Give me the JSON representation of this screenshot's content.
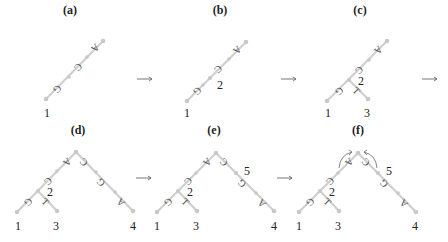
{
  "figure": {
    "panels": [
      {
        "id": "a",
        "label": "(a)",
        "numbers": [
          "1"
        ]
      },
      {
        "id": "b",
        "label": "(b)",
        "numbers": [
          "1",
          "2"
        ]
      },
      {
        "id": "c",
        "label": "(c)",
        "numbers": [
          "1",
          "2",
          "3"
        ]
      },
      {
        "id": "d",
        "label": "(d)",
        "numbers": [
          "1",
          "2",
          "3",
          "4"
        ]
      },
      {
        "id": "e",
        "label": "(e)",
        "numbers": [
          "1",
          "2",
          "3",
          "4",
          "5"
        ]
      },
      {
        "id": "f",
        "label": "(f)",
        "numbers": [
          "1",
          "2",
          "3",
          "4",
          "5"
        ]
      }
    ],
    "bases": {
      "A": "A",
      "C": "C",
      "G": "G",
      "T": "T"
    },
    "arrow_glyph": "⟶",
    "colors": {
      "edge": "#cfcfcf",
      "node": "#c8c8c8",
      "text": "#222222",
      "base_text": "#555555",
      "arrow": "#666666"
    }
  }
}
